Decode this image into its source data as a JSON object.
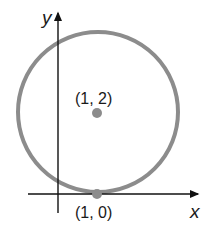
{
  "diagram": {
    "axes": {
      "x_label": "x",
      "y_label": "y"
    },
    "circle": {
      "center": [
        1,
        2
      ],
      "radius": 2,
      "stroke_color": "#8c8c8c"
    },
    "points": [
      {
        "label": "(1, 2)",
        "coords": [
          1,
          2
        ],
        "role": "center"
      },
      {
        "label": "(1, 0)",
        "coords": [
          1,
          0
        ],
        "role": "tangent-point"
      }
    ],
    "point_color": "#8c8c8c",
    "axis_color": "#111111"
  }
}
